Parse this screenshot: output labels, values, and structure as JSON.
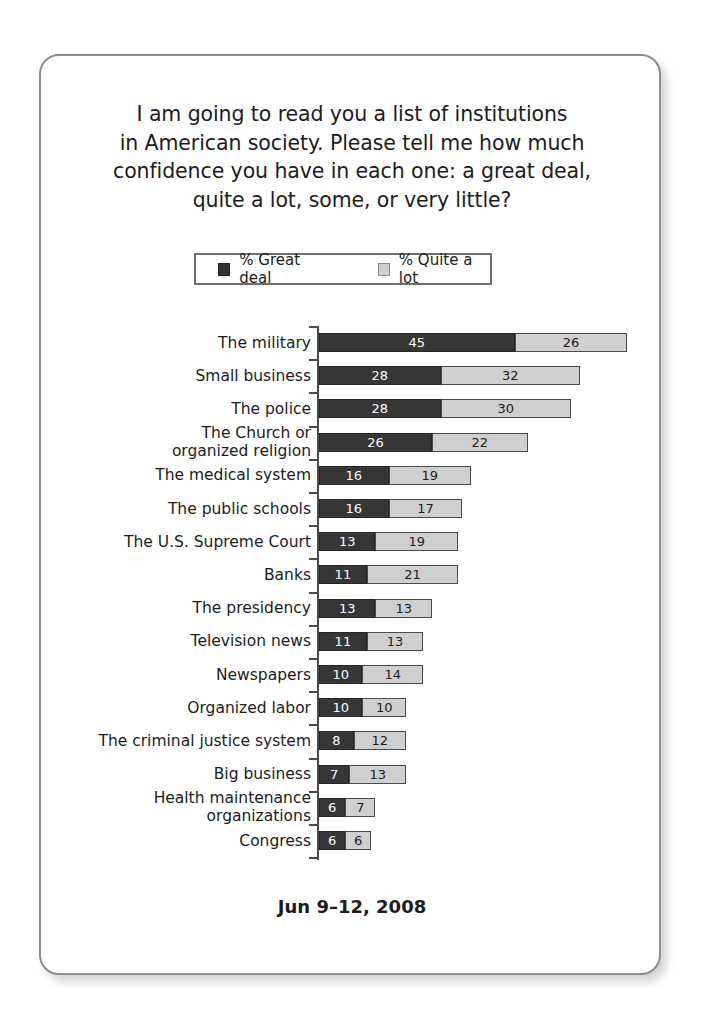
{
  "question": {
    "lines": [
      "I am going to read you a list of institutions",
      "in American society. Please tell me how much",
      "confidence you have in each one: a great deal,",
      "quite a lot, some, or very little?"
    ]
  },
  "legend": {
    "great_deal": "% Great deal",
    "quite_a_lot": "% Quite a lot"
  },
  "footer": {
    "date": "Jun 9–12, 2008"
  },
  "colors": {
    "great_deal": "#363636",
    "quite_a_lot": "#cfcfcf",
    "card_border": "#8d8d8d",
    "axis": "#4a4a4a",
    "text": "#1c1c1c"
  },
  "chart_data": {
    "type": "bar",
    "orientation": "horizontal",
    "stacked": true,
    "title": "I am going to read you a list of institutions in American society. Please tell me how much confidence you have in each one: a great deal, quite a lot, some, or very little?",
    "subtitle": "Jun 9–12, 2008",
    "xlabel": "",
    "ylabel": "",
    "grid": false,
    "legend_position": "top-center",
    "units": "percent",
    "xlim": [
      0,
      71
    ],
    "categories": [
      "The military",
      "Small business",
      "The police",
      "The Church or organized religion",
      "The medical system",
      "The public schools",
      "The U.S. Supreme Court",
      "Banks",
      "The presidency",
      "Television news",
      "Newspapers",
      "Organized labor",
      "The criminal justice system",
      "Big business",
      "Health maintenance organizations",
      "Congress"
    ],
    "category_lines": [
      [
        "The military"
      ],
      [
        "Small business"
      ],
      [
        "The police"
      ],
      [
        "The Church or",
        "organized religion"
      ],
      [
        "The medical system"
      ],
      [
        "The public schools"
      ],
      [
        "The U.S. Supreme Court"
      ],
      [
        "Banks"
      ],
      [
        "The presidency"
      ],
      [
        "Television news"
      ],
      [
        "Newspapers"
      ],
      [
        "Organized labor"
      ],
      [
        "The criminal justice system"
      ],
      [
        "Big business"
      ],
      [
        "Health maintenance",
        "organizations"
      ],
      [
        "Congress"
      ]
    ],
    "series": [
      {
        "name": "% Great deal",
        "color": "#363636",
        "values": [
          45,
          28,
          28,
          26,
          16,
          16,
          13,
          11,
          13,
          11,
          10,
          10,
          8,
          7,
          6,
          6
        ]
      },
      {
        "name": "% Quite a lot",
        "color": "#cfcfcf",
        "values": [
          26,
          32,
          30,
          22,
          19,
          17,
          19,
          21,
          13,
          13,
          14,
          10,
          12,
          13,
          7,
          6
        ]
      }
    ],
    "totals": [
      71,
      60,
      58,
      48,
      35,
      33,
      32,
      32,
      26,
      24,
      24,
      20,
      20,
      20,
      13,
      12
    ]
  }
}
